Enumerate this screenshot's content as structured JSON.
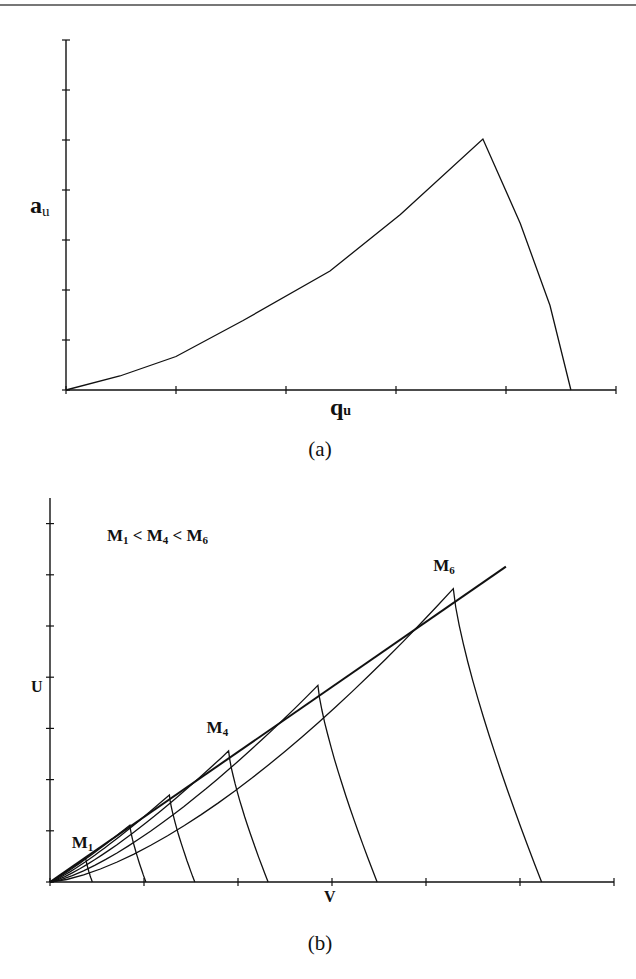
{
  "chart_data": [
    {
      "id": "a",
      "type": "line",
      "caption": "(a)",
      "title": "",
      "xlabel": "q",
      "xlabel_sub": "u",
      "ylabel": "a",
      "ylabel_sub": "u",
      "xlim": [
        0,
        5
      ],
      "ylim": [
        0,
        7
      ],
      "x_ticks": [
        0,
        1,
        2,
        3,
        4,
        5
      ],
      "y_ticks": [
        0,
        1,
        2,
        3,
        4,
        5,
        6,
        7
      ],
      "tick_labels_shown": false,
      "grid": false,
      "series": [
        {
          "name": "a_u vs q_u",
          "points": [
            [
              0,
              0
            ],
            [
              0.49,
              0.28
            ],
            [
              1.0,
              0.67
            ],
            [
              1.61,
              1.39
            ],
            [
              2.4,
              2.38
            ],
            [
              3.04,
              3.51
            ],
            [
              3.79,
              5.02
            ],
            [
              4.13,
              3.33
            ],
            [
              4.4,
              1.69
            ],
            [
              4.59,
              0
            ]
          ]
        }
      ]
    },
    {
      "id": "b",
      "type": "line",
      "caption": "(b)",
      "title": "",
      "annotation": {
        "text_parts": [
          "M",
          "1",
          " < ",
          "M",
          "4",
          " < ",
          "M",
          "6"
        ],
        "position": "top-left"
      },
      "xlabel": "V",
      "ylabel": "U",
      "xlim": [
        0,
        6
      ],
      "ylim": [
        0,
        7.5
      ],
      "x_ticks": [
        0,
        1,
        2,
        3,
        4,
        5,
        6
      ],
      "y_ticks": [
        0,
        1,
        2,
        3,
        4,
        5,
        6,
        7
      ],
      "tick_labels_shown": false,
      "grid": false,
      "reference_line": {
        "name": "straight line",
        "points": [
          [
            0,
            0
          ],
          [
            4.85,
            6.16
          ]
        ]
      },
      "series": [
        {
          "name": "M1",
          "label": "M",
          "label_sub": "1",
          "labeled": true,
          "peak": [
            0.38,
            0.47
          ],
          "end_x": 0.45,
          "rise_power": 1.05
        },
        {
          "name": "M2",
          "label": "M",
          "label_sub": "2",
          "labeled": false,
          "peak": [
            0.85,
            1.11
          ],
          "end_x": 1.02,
          "rise_power": 1.12
        },
        {
          "name": "M3",
          "label": "M",
          "label_sub": "3",
          "labeled": false,
          "peak": [
            1.27,
            1.7
          ],
          "end_x": 1.54,
          "rise_power": 1.2
        },
        {
          "name": "M4",
          "label": "M",
          "label_sub": "4",
          "labeled": true,
          "peak": [
            1.9,
            2.56
          ],
          "end_x": 2.32,
          "rise_power": 1.28
        },
        {
          "name": "M5",
          "label": "M",
          "label_sub": "5",
          "labeled": false,
          "peak": [
            2.85,
            3.84
          ],
          "end_x": 3.48,
          "rise_power": 1.38
        },
        {
          "name": "M6",
          "label": "M",
          "label_sub": "6",
          "labeled": true,
          "peak": [
            4.29,
            5.73
          ],
          "end_x": 5.23,
          "rise_power": 1.5
        }
      ]
    }
  ]
}
